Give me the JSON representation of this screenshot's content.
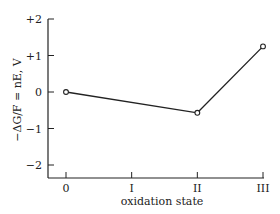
{
  "chart_data": {
    "type": "line",
    "title": "",
    "xlabel": "oxidation state",
    "ylabel": "−ΔG/F = nE, V",
    "categories": [
      "0",
      "I",
      "II",
      "III"
    ],
    "x": [
      0,
      1,
      2,
      3
    ],
    "series": [
      {
        "name": "Frost diagram",
        "points": [
          {
            "x": 0,
            "y": 0
          },
          {
            "x": 2,
            "y": -0.57
          },
          {
            "x": 3,
            "y": 1.25
          }
        ],
        "marker": "open-circle",
        "color": "#222222"
      }
    ],
    "yticks": [
      {
        "value": 2,
        "label": "+2"
      },
      {
        "value": 1,
        "label": "+1"
      },
      {
        "value": 0,
        "label": "0"
      },
      {
        "value": -1,
        "label": "−1"
      },
      {
        "value": -2,
        "label": "−2"
      }
    ],
    "xticks": [
      {
        "value": 0,
        "label": "0"
      },
      {
        "value": 1,
        "label": "I"
      },
      {
        "value": 2,
        "label": "II"
      },
      {
        "value": 3,
        "label": "III"
      }
    ],
    "ylim": [
      -2.3,
      2.0
    ],
    "xlim": [
      -0.27,
      3.0
    ],
    "grid": false,
    "legend": null
  }
}
